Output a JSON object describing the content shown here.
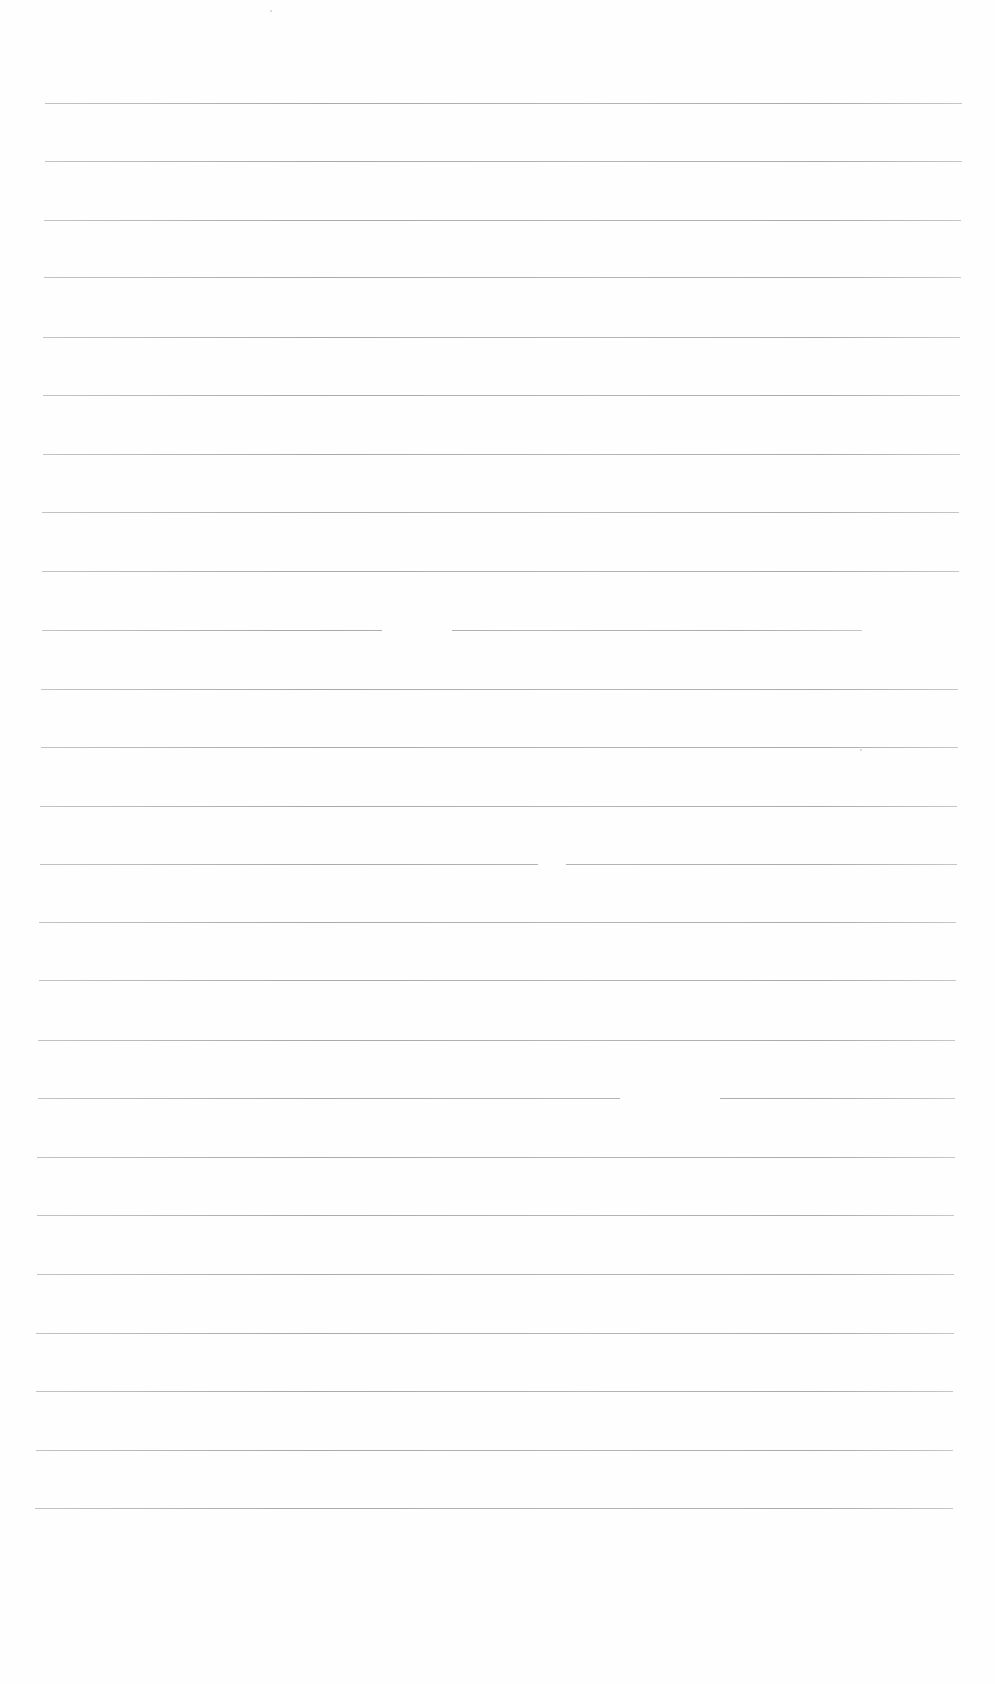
{
  "document": {
    "type": "blank lined paper",
    "background": "#fefefe",
    "rule_color": "#a0a0a0",
    "rules": [
      {
        "y": 103,
        "x1": 45,
        "x2": 962,
        "gaps": []
      },
      {
        "y": 161,
        "x1": 45,
        "x2": 962,
        "gaps": []
      },
      {
        "y": 220,
        "x1": 44,
        "x2": 961,
        "gaps": []
      },
      {
        "y": 277,
        "x1": 44,
        "x2": 961,
        "gaps": []
      },
      {
        "y": 337,
        "x1": 43,
        "x2": 960,
        "gaps": []
      },
      {
        "y": 395,
        "x1": 43,
        "x2": 960,
        "gaps": []
      },
      {
        "y": 454,
        "x1": 43,
        "x2": 960,
        "gaps": []
      },
      {
        "y": 512,
        "x1": 42,
        "x2": 959,
        "gaps": []
      },
      {
        "y": 571,
        "x1": 42,
        "x2": 959,
        "gaps": []
      },
      {
        "y": 630,
        "x1": 42,
        "x2": 862,
        "gaps": [
          [
            382,
            452
          ]
        ]
      },
      {
        "y": 689,
        "x1": 41,
        "x2": 958,
        "gaps": []
      },
      {
        "y": 747,
        "x1": 41,
        "x2": 958,
        "gaps": []
      },
      {
        "y": 806,
        "x1": 40,
        "x2": 957,
        "gaps": []
      },
      {
        "y": 864,
        "x1": 40,
        "x2": 957,
        "gaps": [
          [
            538,
            566
          ]
        ]
      },
      {
        "y": 922,
        "x1": 39,
        "x2": 956,
        "gaps": []
      },
      {
        "y": 980,
        "x1": 39,
        "x2": 956,
        "gaps": []
      },
      {
        "y": 1040,
        "x1": 38,
        "x2": 955,
        "gaps": []
      },
      {
        "y": 1098,
        "x1": 38,
        "x2": 955,
        "gaps": [
          [
            620,
            720
          ]
        ]
      },
      {
        "y": 1157,
        "x1": 37,
        "x2": 955,
        "gaps": []
      },
      {
        "y": 1215,
        "x1": 37,
        "x2": 954,
        "gaps": []
      },
      {
        "y": 1274,
        "x1": 37,
        "x2": 954,
        "gaps": []
      },
      {
        "y": 1333,
        "x1": 36,
        "x2": 954,
        "gaps": []
      },
      {
        "y": 1391,
        "x1": 36,
        "x2": 953,
        "gaps": []
      },
      {
        "y": 1450,
        "x1": 36,
        "x2": 953,
        "gaps": []
      },
      {
        "y": 1508,
        "x1": 35,
        "x2": 953,
        "gaps": []
      }
    ],
    "marks": [
      {
        "x": 860,
        "y": 749
      },
      {
        "x": 270,
        "y": 10
      }
    ]
  }
}
